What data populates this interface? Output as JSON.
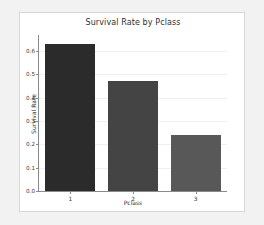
{
  "chart_data": {
    "type": "bar",
    "title": "Survival Rate by Pclass",
    "xlabel": "Pclass",
    "ylabel": "Survival Rate",
    "categories": [
      "1",
      "2",
      "3"
    ],
    "values": [
      0.63,
      0.47,
      0.24
    ],
    "bar_colors": [
      "#2b2b2b",
      "#444444",
      "#585858"
    ],
    "ylim": [
      0.0,
      0.66
    ],
    "yticks": [
      0.0,
      0.1,
      0.2,
      0.3,
      0.4,
      0.5,
      0.6
    ],
    "ytick_labels": [
      "0.0",
      "0.1",
      "0.2",
      "0.3",
      "0.4",
      "0.5",
      "0.6"
    ],
    "grid": "horizontal",
    "legend": null,
    "background": "#ffffff",
    "page_background": "#f2f2f2"
  }
}
